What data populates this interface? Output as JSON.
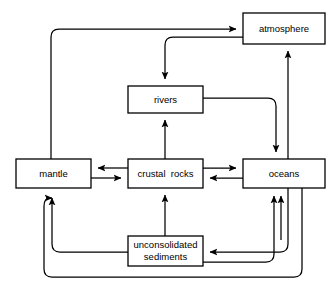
{
  "diagram": {
    "type": "flow-diagram",
    "background_color": "#ffffff",
    "line_color": "#000000",
    "box_fill": "#ffffff",
    "nodes": [
      {
        "id": "atmosphere",
        "label": "atmosphere",
        "x": 243,
        "y": 13,
        "w": 82,
        "h": 31,
        "lines": [
          "atmosphere"
        ]
      },
      {
        "id": "rivers",
        "label": "rivers",
        "x": 128,
        "y": 86,
        "w": 75,
        "h": 27,
        "lines": [
          "rivers"
        ]
      },
      {
        "id": "mantle",
        "label": "mantle",
        "x": 16,
        "y": 159,
        "w": 75,
        "h": 29,
        "lines": [
          "mantle"
        ]
      },
      {
        "id": "crustal_rocks",
        "label": "crustal  rocks",
        "x": 128,
        "y": 159,
        "w": 75,
        "h": 29,
        "lines": [
          "crustal  rocks"
        ]
      },
      {
        "id": "oceans",
        "label": "oceans",
        "x": 243,
        "y": 159,
        "w": 82,
        "h": 29,
        "lines": [
          "oceans"
        ]
      },
      {
        "id": "unconsolidated_sediments",
        "label": "unconsolidated sediments",
        "x": 128,
        "y": 236,
        "w": 75,
        "h": 30,
        "lines": [
          "unconsolidated",
          "sediments"
        ]
      }
    ],
    "edges": [
      {
        "id": "mantle-to-atmosphere",
        "from": "mantle",
        "to": "atmosphere",
        "path": "M 51 159 L 51 37 Q 51 29 59 29 L 236 29"
      },
      {
        "id": "atmosphere-to-rivers",
        "from": "atmosphere",
        "to": "rivers",
        "path": "M 243 37 L 173 37 Q 165 37 165 45 L 165 79"
      },
      {
        "id": "rivers-to-oceans",
        "from": "rivers",
        "to": "oceans",
        "path": "M 203 98 L 268 98 Q 276 98 276 106 L 276 152"
      },
      {
        "id": "oceans-to-atmosphere",
        "from": "oceans",
        "to": "atmosphere",
        "path": "M 288 159 L 288 51"
      },
      {
        "id": "crustal-rocks-to-rivers",
        "from": "crustal_rocks",
        "to": "rivers",
        "path": "M 165 159 L 165 120"
      },
      {
        "id": "crustal-rocks-to-mantle",
        "from": "crustal_rocks",
        "to": "mantle",
        "path": "M 128 168 L 98 168"
      },
      {
        "id": "mantle-to-crustal-rocks",
        "from": "mantle",
        "to": "crustal_rocks",
        "path": "M 91 178 L 121 178"
      },
      {
        "id": "crustal-rocks-to-oceans",
        "from": "crustal_rocks",
        "to": "oceans",
        "path": "M 203 168 L 236 168"
      },
      {
        "id": "oceans-to-crustal-rocks",
        "from": "oceans",
        "to": "crustal_rocks",
        "path": "M 243 178 L 210 178"
      },
      {
        "id": "sediments-to-crustal-rocks",
        "from": "unconsolidated_sediments",
        "to": "crustal_rocks",
        "path": "M 165 236 L 165 195"
      },
      {
        "id": "sediments-to-mantle",
        "from": "unconsolidated_sediments",
        "to": "mantle",
        "path": "M 128 252 L 60 252 Q 52 252 52 244 L 52 195"
      },
      {
        "id": "oceans-to-sediments",
        "from": "oceans",
        "to": "unconsolidated_sediments",
        "path": "M 288 188 L 288 244 Q 288 252 280 252 L 210 252"
      },
      {
        "id": "sediments-to-oceans",
        "from": "unconsolidated_sediments",
        "to": "oceans",
        "path": "M 203 262 L 266 262 Q 274 262 274 254 L 274 196"
      },
      {
        "id": "oceans-outer-loop-to-mantle",
        "from": "oceans",
        "to": "mantle",
        "path": "M 302 188 L 302 269 Q 302 277 294 277 L 52 277 Q 44 277 44 269 L 44 200 Q 44 195 48 195 L 52 195"
      },
      {
        "id": "oceans-inner-to-oceans-bottom",
        "from": "oceans",
        "to": "oceans",
        "path": "M 281 196 L 281 240"
      }
    ],
    "arrowhead": {
      "width": 7,
      "height": 9
    }
  }
}
